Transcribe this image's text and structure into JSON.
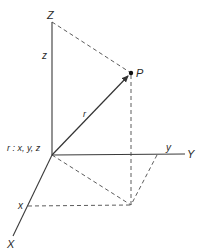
{
  "diagram": {
    "type": "3d-cartesian-coordinates",
    "axes": {
      "X": {
        "label": "X",
        "component_label": "x"
      },
      "Y": {
        "label": "Y",
        "component_label": "y"
      },
      "Z": {
        "label": "Z",
        "component_label": "z"
      }
    },
    "point": {
      "label": "P"
    },
    "vector": {
      "label": "r",
      "definition": "r : x, y, z"
    },
    "colors": {
      "ink": "#333333",
      "background": "#ffffff"
    }
  }
}
